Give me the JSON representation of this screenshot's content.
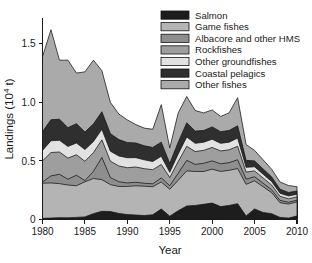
{
  "chart_data": {
    "type": "area",
    "stacked": true,
    "title": "",
    "xlabel": "Year",
    "ylabel": "Landings (10⁴ t)",
    "xlim": [
      1980,
      2010
    ],
    "ylim": [
      0,
      1.72
    ],
    "grid": false,
    "legend_position": "top-right",
    "x": [
      1980,
      1981,
      1982,
      1983,
      1984,
      1985,
      1986,
      1987,
      1988,
      1989,
      1990,
      1991,
      1992,
      1993,
      1994,
      1995,
      1996,
      1997,
      1998,
      1999,
      2000,
      2001,
      2002,
      2003,
      2004,
      2005,
      2006,
      2007,
      2008,
      2009,
      2010
    ],
    "xticks": [
      1980,
      1985,
      1990,
      1995,
      2000,
      2005,
      2010
    ],
    "xticklabels": [
      "1980",
      "1985",
      "1990",
      "1995",
      "2000",
      "2005",
      "2010"
    ],
    "yticks": [
      0,
      0.5,
      1.0,
      1.5
    ],
    "yticklabels": [
      "0",
      "0.5",
      "1.0",
      "1.5"
    ],
    "series": [
      {
        "name": "Salmon",
        "color": "#1d1d1d",
        "values": [
          0.01,
          0.012,
          0.016,
          0.014,
          0.018,
          0.022,
          0.05,
          0.07,
          0.068,
          0.052,
          0.042,
          0.038,
          0.034,
          0.04,
          0.09,
          0.028,
          0.075,
          0.115,
          0.12,
          0.13,
          0.14,
          0.11,
          0.12,
          0.135,
          0.03,
          0.09,
          0.06,
          0.05,
          0.018,
          0.012,
          0.03
        ]
      },
      {
        "name": "Game fishes",
        "color": "#b4b4b4",
        "values": [
          0.3,
          0.3,
          0.29,
          0.28,
          0.27,
          0.3,
          0.3,
          0.27,
          0.23,
          0.23,
          0.24,
          0.25,
          0.25,
          0.24,
          0.23,
          0.23,
          0.26,
          0.3,
          0.29,
          0.28,
          0.29,
          0.3,
          0.3,
          0.3,
          0.27,
          0.24,
          0.22,
          0.18,
          0.125,
          0.12,
          0.12
        ]
      },
      {
        "name": "Albacore and other HMS",
        "color": "#8e8e8e",
        "values": [
          0.01,
          0.06,
          0.08,
          0.05,
          0.09,
          0.01,
          0.06,
          0.19,
          0.06,
          0.04,
          0.03,
          0.03,
          0.025,
          0.025,
          0.035,
          0.03,
          0.06,
          0.09,
          0.06,
          0.07,
          0.07,
          0.065,
          0.065,
          0.075,
          0.045,
          0.035,
          0.03,
          0.025,
          0.02,
          0.015,
          0.015
        ]
      },
      {
        "name": "Rockfishes",
        "color": "#9e9e9e",
        "values": [
          0.18,
          0.2,
          0.19,
          0.18,
          0.175,
          0.165,
          0.16,
          0.15,
          0.14,
          0.135,
          0.13,
          0.13,
          0.125,
          0.12,
          0.115,
          0.07,
          0.1,
          0.12,
          0.11,
          0.11,
          0.115,
          0.11,
          0.11,
          0.115,
          0.06,
          0.05,
          0.045,
          0.04,
          0.035,
          0.03,
          0.028
        ]
      },
      {
        "name": "Other groundfishes",
        "color": "#e2e2e2",
        "values": [
          0.09,
          0.1,
          0.1,
          0.1,
          0.1,
          0.1,
          0.095,
          0.09,
          0.085,
          0.085,
          0.085,
          0.08,
          0.075,
          0.07,
          0.07,
          0.045,
          0.065,
          0.08,
          0.07,
          0.07,
          0.07,
          0.065,
          0.065,
          0.07,
          0.04,
          0.035,
          0.032,
          0.03,
          0.026,
          0.024,
          0.022
        ]
      },
      {
        "name": "Coastal pelagics",
        "color": "#2f2f2f",
        "values": [
          0.16,
          0.18,
          0.18,
          0.16,
          0.165,
          0.15,
          0.15,
          0.15,
          0.15,
          0.14,
          0.13,
          0.125,
          0.12,
          0.12,
          0.12,
          0.075,
          0.1,
          0.12,
          0.105,
          0.1,
          0.105,
          0.1,
          0.1,
          0.105,
          0.06,
          0.05,
          0.045,
          0.04,
          0.035,
          0.03,
          0.028
        ]
      },
      {
        "name": "Other fishes",
        "color": "#aaaaaa",
        "values": [
          0.64,
          0.768,
          0.504,
          0.576,
          0.432,
          0.513,
          0.545,
          0.35,
          0.267,
          0.218,
          0.193,
          0.157,
          0.151,
          0.155,
          0.32,
          0.132,
          0.25,
          0.225,
          0.175,
          0.15,
          0.145,
          0.13,
          0.15,
          0.24,
          0.135,
          0.09,
          0.078,
          0.065,
          0.061,
          0.059,
          0.037
        ]
      }
    ]
  },
  "legend": {
    "items": [
      {
        "label": "Salmon",
        "color": "#1d1d1d"
      },
      {
        "label": "Game fishes",
        "color": "#b4b4b4"
      },
      {
        "label": "Albacore and other HMS",
        "color": "#8e8e8e"
      },
      {
        "label": "Rockfishes",
        "color": "#9e9e9e"
      },
      {
        "label": "Other groundfishes",
        "color": "#e2e2e2"
      },
      {
        "label": "Coastal pelagics",
        "color": "#2f2f2f"
      },
      {
        "label": "Other fishes",
        "color": "#aaaaaa"
      }
    ]
  },
  "axes": {
    "ylabel": "Landings (10⁴ t)",
    "ylabel_prefix": "Landings (10",
    "ylabel_exponent": "4",
    "ylabel_suffix": " t)",
    "xlabel": "Year"
  }
}
